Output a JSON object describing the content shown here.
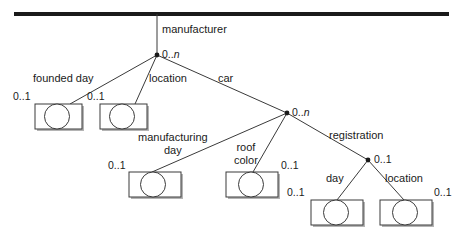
{
  "diagram": {
    "type": "hierarchical-data-model-tree",
    "root_bar": {
      "name": "root-schema-bar"
    },
    "nodes": [
      {
        "id": "manufacturer",
        "kind": "inner",
        "cardinality": "0..n",
        "edge_label": "manufacturer"
      },
      {
        "id": "founded-day",
        "kind": "leaf",
        "cardinality": "0..1",
        "edge_label": "founded day"
      },
      {
        "id": "location-1",
        "kind": "leaf",
        "cardinality": "0..1",
        "edge_label": "location"
      },
      {
        "id": "car",
        "kind": "inner",
        "cardinality": "0..n",
        "edge_label": "car"
      },
      {
        "id": "manufacturing-day",
        "kind": "leaf",
        "cardinality": "0..1",
        "edge_label": "manufacturing day"
      },
      {
        "id": "roof-color",
        "kind": "leaf",
        "cardinality": "0..1",
        "edge_label": "roof color"
      },
      {
        "id": "registration",
        "kind": "inner",
        "cardinality": "0..1",
        "edge_label": "registration"
      },
      {
        "id": "reg-day",
        "kind": "leaf",
        "cardinality": "0..1",
        "edge_label": "day"
      },
      {
        "id": "reg-location",
        "kind": "leaf",
        "cardinality": "0..1",
        "edge_label": "location"
      }
    ],
    "labels": {
      "manufacturer": "manufacturer",
      "founded_day": "founded day",
      "location_top": "location",
      "car": "car",
      "manufacturing": "manufacturing",
      "day_line2": "day",
      "roof": "roof",
      "color": "color",
      "registration": "registration",
      "reg_day": "day",
      "reg_location": "location"
    },
    "cardinalities": {
      "manufacturer": "0..",
      "manufacturer_n": "n",
      "founded_day": "0..1",
      "location_top": "0..1",
      "car": "0..",
      "car_n": "n",
      "manufacturing_day": "0..1",
      "roof_color": "0..1",
      "registration": "0..1",
      "reg_day": "0..1",
      "reg_location": "0..1"
    },
    "colors": {
      "line": "#3a3a3a",
      "bar": "#1a1a1a",
      "shadow": "#b4b4b4",
      "text": "#1a1a1a",
      "background": "#ffffff"
    }
  }
}
